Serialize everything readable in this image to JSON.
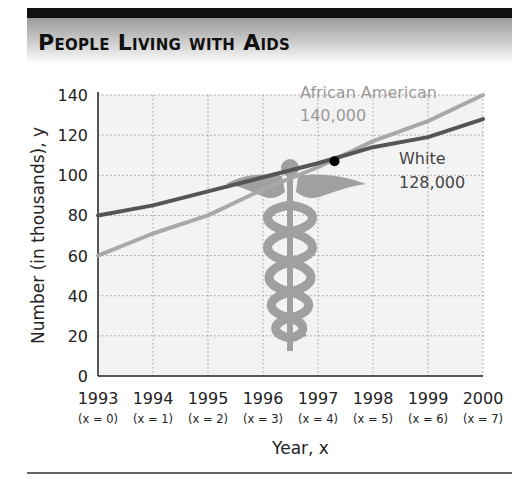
{
  "title": "People Living with Aids",
  "chart_data": {
    "type": "line",
    "title": "People Living with Aids",
    "xlabel": "Year, x",
    "ylabel": "Number (in thousands), y",
    "categories": [
      "1993",
      "1994",
      "1995",
      "1996",
      "1997",
      "1998",
      "1999",
      "2000"
    ],
    "x_sublabels": [
      "(x = 0)",
      "(x = 1)",
      "(x = 2)",
      "(x = 3)",
      "(x = 4)",
      "(x = 5)",
      "(x = 6)",
      "(x = 7)"
    ],
    "x": [
      0,
      1,
      2,
      3,
      4,
      5,
      6,
      7
    ],
    "yticks": [
      0,
      20,
      40,
      60,
      80,
      100,
      120,
      140
    ],
    "ylim": [
      0,
      140
    ],
    "grid": true,
    "series": [
      {
        "name": "African American",
        "values": [
          60,
          71,
          80,
          93,
          104,
          117,
          127,
          140
        ],
        "color": "#a8a8a8",
        "end_label": "140,000"
      },
      {
        "name": "White",
        "values": [
          80,
          85,
          92,
          99,
          106,
          114,
          119,
          128
        ],
        "color": "#555555",
        "end_label": "128,000"
      }
    ],
    "annotations": [
      {
        "text": "African American",
        "series": "African American"
      },
      {
        "text": "140,000",
        "series": "African American"
      },
      {
        "text": "White",
        "series": "White"
      },
      {
        "text": "128,000",
        "series": "White"
      },
      {
        "type": "point",
        "label": "intersection",
        "x": 4.3,
        "y": 107
      }
    ],
    "decoration": "caduceus"
  }
}
